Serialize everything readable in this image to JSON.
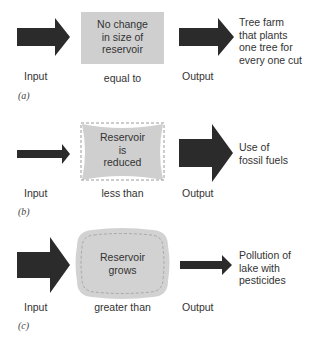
{
  "colors": {
    "arrow": "#2b2b2b",
    "box_fill": "#cfcfcf",
    "box_dash": "#9a9a9a",
    "text": "#333333"
  },
  "panels": [
    {
      "id": "a",
      "caption": "(a)",
      "input_label": "Input",
      "relation_label": "equal to",
      "output_label": "Output",
      "reservoir_text": [
        "No change",
        "in size of",
        "reservoir"
      ],
      "output_example": [
        "Tree farm",
        "that plants",
        "one tree for",
        "every one cut"
      ],
      "input_arrow_size": "large",
      "output_arrow_size": "large",
      "reservoir_shape": "rectangle"
    },
    {
      "id": "b",
      "caption": "(b)",
      "input_label": "Input",
      "relation_label": "less than",
      "output_label": "Output",
      "reservoir_text": [
        "Reservoir",
        "is",
        "reduced"
      ],
      "output_example": [
        "Use of",
        "fossil fuels"
      ],
      "input_arrow_size": "small",
      "output_arrow_size": "large",
      "reservoir_shape": "pinched"
    },
    {
      "id": "c",
      "caption": "(c)",
      "input_label": "Input",
      "relation_label": "greater than",
      "output_label": "Output",
      "reservoir_text": [
        "Reservoir",
        "grows"
      ],
      "output_example": [
        "Pollution of",
        "lake with",
        "pesticides"
      ],
      "input_arrow_size": "large",
      "output_arrow_size": "small",
      "reservoir_shape": "bulged"
    }
  ]
}
